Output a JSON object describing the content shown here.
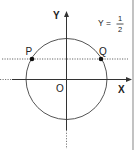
{
  "diagram": {
    "type": "unit-circle",
    "axes": {
      "x_label": "X",
      "y_label": "Y",
      "origin_label": "O"
    },
    "line": {
      "equation_lhs": "Y =",
      "numerator": "1",
      "denominator": "2",
      "style": "dotted"
    },
    "points": [
      {
        "label": "P",
        "side": "left"
      },
      {
        "label": "Q",
        "side": "right"
      }
    ],
    "colors": {
      "stroke": "#555555",
      "text": "#222222",
      "border": "#9a9a9a",
      "point": "#111111"
    }
  }
}
